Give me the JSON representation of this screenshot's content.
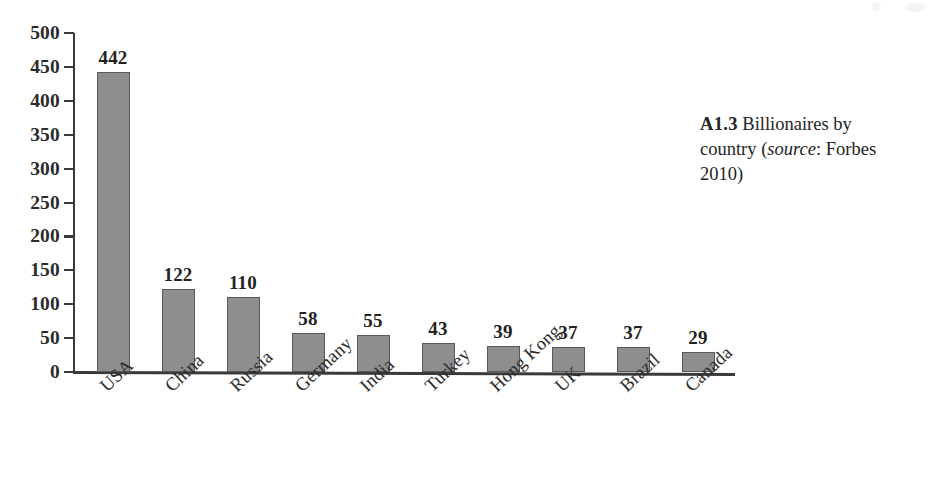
{
  "figure": {
    "caption_number": "A1.3",
    "caption_text_1": "Billionaires",
    "caption_text_2": "by country (",
    "caption_source_word": "source",
    "caption_text_3": ": ",
    "caption_text_4": "Forbes 2010)"
  },
  "chart_data": {
    "type": "bar",
    "title": "",
    "subtitle": "",
    "xlabel": "",
    "ylabel": "",
    "ylim": [
      0,
      500
    ],
    "ytick_step": 50,
    "yticks": [
      0,
      50,
      100,
      150,
      200,
      250,
      300,
      350,
      400,
      450,
      500
    ],
    "ytick_labels": [
      "0",
      "50",
      "100",
      "150",
      "200",
      "250",
      "300",
      "350",
      "400",
      "450",
      "500"
    ],
    "grid": false,
    "legend": false,
    "legend_position": "none",
    "xtick_rotation_deg": -43,
    "bar_color": "#8e8e8e",
    "bar_edge_color": "#595959",
    "axis_color": "#3a3a3a",
    "value_labels_shown": true,
    "categories": [
      "USA",
      "China",
      "Russia",
      "Germany",
      "India",
      "Turkey",
      "Hong Kong",
      "UK",
      "Brazil",
      "Canada"
    ],
    "values": [
      442,
      122,
      110,
      58,
      55,
      43,
      39,
      37,
      37,
      29
    ],
    "value_labels": [
      "442",
      "122",
      "110",
      "58",
      "55",
      "43",
      "39",
      "37",
      "37",
      "29"
    ]
  }
}
